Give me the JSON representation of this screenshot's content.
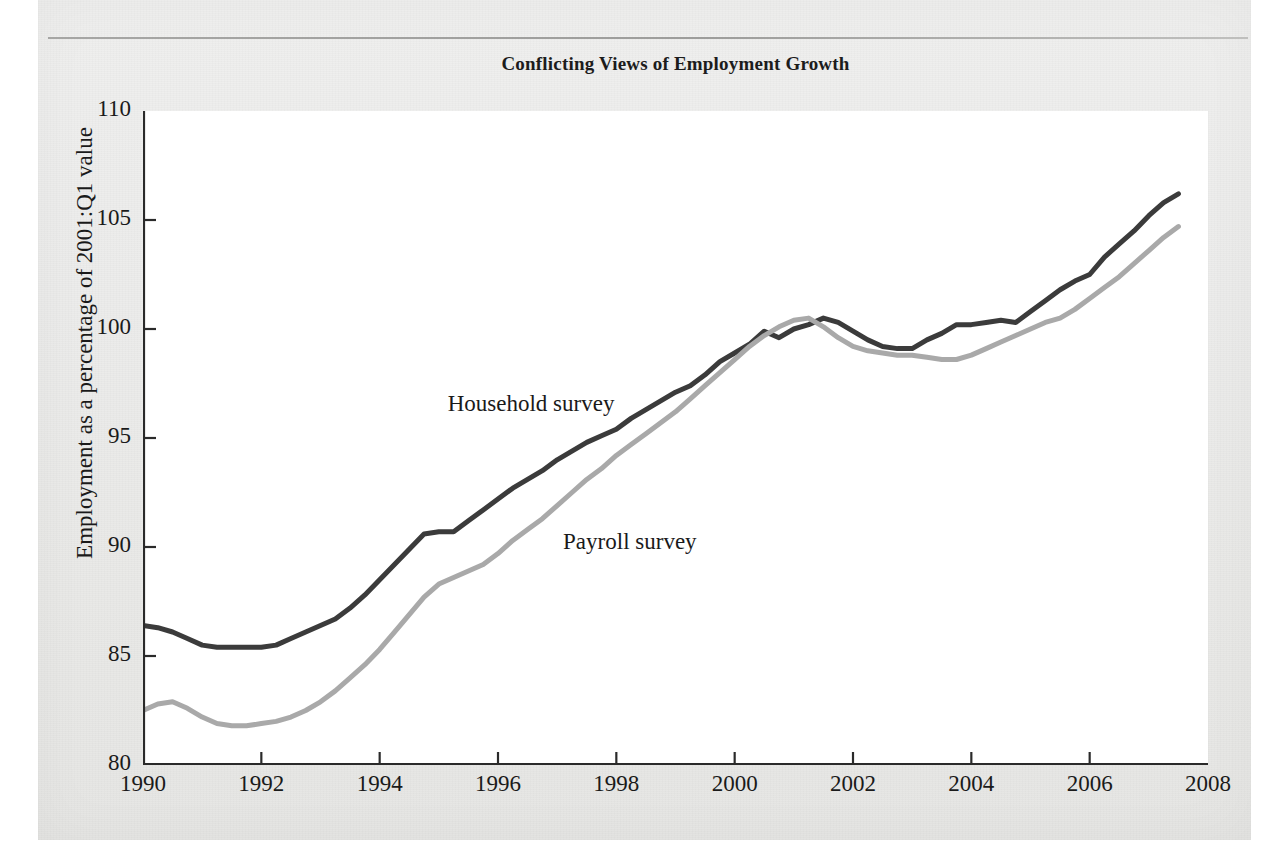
{
  "page": {
    "background_color": "#ececeb",
    "paper_texture": "scanned-page"
  },
  "chart_data": {
    "type": "line",
    "title": "Conflicting Views of Employment Growth",
    "xlabel": "",
    "ylabel": "Employment as a percentage of 2001:Q1 value",
    "xlim": [
      1990,
      2008
    ],
    "ylim": [
      80,
      110
    ],
    "xticks": [
      "1990",
      "1992",
      "1994",
      "1996",
      "1998",
      "2000",
      "2002",
      "2004",
      "2006",
      "2008"
    ],
    "yticks": [
      "80",
      "85",
      "90",
      "95",
      "100",
      "105",
      "110"
    ],
    "grid": false,
    "legend_position": "inline-annotation",
    "annotations": [
      {
        "text": "Household survey",
        "x": 1995.15,
        "y": 96.4
      },
      {
        "text": "Payroll survey",
        "x": 1997.1,
        "y": 90.1
      }
    ],
    "series": [
      {
        "name": "Household survey",
        "color": "#3b3b3b",
        "x": [
          1990,
          1990.25,
          1990.5,
          1990.75,
          1991,
          1991.25,
          1991.5,
          1991.75,
          1992,
          1992.25,
          1992.5,
          1992.75,
          1993,
          1993.25,
          1993.5,
          1993.75,
          1994,
          1994.25,
          1994.5,
          1994.75,
          1995,
          1995.25,
          1995.5,
          1995.75,
          1996,
          1996.25,
          1996.5,
          1996.75,
          1997,
          1997.25,
          1997.5,
          1997.75,
          1998,
          1998.25,
          1998.5,
          1998.75,
          1999,
          1999.25,
          1999.5,
          1999.75,
          2000,
          2000.25,
          2000.5,
          2000.75,
          2001,
          2001.25,
          2001.5,
          2001.75,
          2002,
          2002.25,
          2002.5,
          2002.75,
          2003,
          2003.25,
          2003.5,
          2003.75,
          2004,
          2004.25,
          2004.5,
          2004.75,
          2005,
          2005.25,
          2005.5,
          2005.75,
          2006,
          2006.25,
          2006.5,
          2006.75,
          2007,
          2007.25,
          2007.5
        ],
        "y": [
          86.4,
          86.3,
          86.1,
          85.8,
          85.5,
          85.4,
          85.4,
          85.4,
          85.4,
          85.5,
          85.8,
          86.1,
          86.4,
          86.7,
          87.2,
          87.8,
          88.5,
          89.2,
          89.9,
          90.6,
          90.7,
          90.7,
          91.2,
          91.7,
          92.2,
          92.7,
          93.1,
          93.5,
          94.0,
          94.4,
          94.8,
          95.1,
          95.4,
          95.9,
          96.3,
          96.7,
          97.1,
          97.4,
          97.9,
          98.5,
          98.9,
          99.3,
          99.9,
          99.6,
          100.0,
          100.2,
          100.5,
          100.3,
          99.9,
          99.5,
          99.2,
          99.1,
          99.1,
          99.5,
          99.8,
          100.2,
          100.2,
          100.3,
          100.4,
          100.3,
          100.8,
          101.3,
          101.8,
          102.2,
          102.5,
          103.3,
          103.9,
          104.5,
          105.2,
          105.8,
          106.2
        ]
      },
      {
        "name": "Payroll survey",
        "color": "#a9a9a9",
        "x": [
          1990,
          1990.25,
          1990.5,
          1990.75,
          1991,
          1991.25,
          1991.5,
          1991.75,
          1992,
          1992.25,
          1992.5,
          1992.75,
          1993,
          1993.25,
          1993.5,
          1993.75,
          1994,
          1994.25,
          1994.5,
          1994.75,
          1995,
          1995.25,
          1995.5,
          1995.75,
          1996,
          1996.25,
          1996.5,
          1996.75,
          1997,
          1997.25,
          1997.5,
          1997.75,
          1998,
          1998.25,
          1998.5,
          1998.75,
          1999,
          1999.25,
          1999.5,
          1999.75,
          2000,
          2000.25,
          2000.5,
          2000.75,
          2001,
          2001.25,
          2001.5,
          2001.75,
          2002,
          2002.25,
          2002.5,
          2002.75,
          2003,
          2003.25,
          2003.5,
          2003.75,
          2004,
          2004.25,
          2004.5,
          2004.75,
          2005,
          2005.25,
          2005.5,
          2005.75,
          2006,
          2006.25,
          2006.5,
          2006.75,
          2007,
          2007.25,
          2007.5
        ],
        "y": [
          82.5,
          82.8,
          82.9,
          82.6,
          82.2,
          81.9,
          81.8,
          81.8,
          81.9,
          82.0,
          82.2,
          82.5,
          82.9,
          83.4,
          84.0,
          84.6,
          85.3,
          86.1,
          86.9,
          87.7,
          88.3,
          88.6,
          88.9,
          89.2,
          89.7,
          90.3,
          90.8,
          91.3,
          91.9,
          92.5,
          93.1,
          93.6,
          94.2,
          94.7,
          95.2,
          95.7,
          96.2,
          96.8,
          97.4,
          98.0,
          98.6,
          99.2,
          99.7,
          100.1,
          100.4,
          100.5,
          100.1,
          99.6,
          99.2,
          99.0,
          98.9,
          98.8,
          98.8,
          98.7,
          98.6,
          98.6,
          98.8,
          99.1,
          99.4,
          99.7,
          100.0,
          100.3,
          100.5,
          100.9,
          101.4,
          101.9,
          102.4,
          103.0,
          103.6,
          104.2,
          104.7
        ]
      }
    ]
  }
}
